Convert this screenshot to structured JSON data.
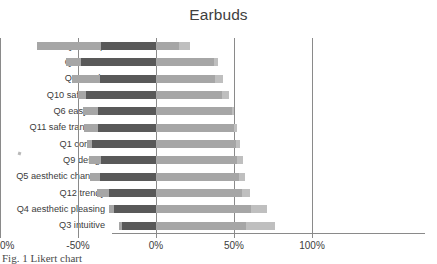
{
  "chart_data": {
    "type": "bar",
    "title": "Earbuds",
    "subtype": "diverging-stacked-bar",
    "orientation": "horizontal",
    "xlabel": "",
    "ylabel": "",
    "xlim": [
      -100,
      100
    ],
    "xticks": [
      -100,
      -50,
      0,
      50,
      100
    ],
    "xticklabels": [
      "-100%",
      "-50%",
      "0%",
      "50%",
      "100%"
    ],
    "grid": true,
    "gridlines_at": [
      -100,
      -50,
      0,
      50,
      100
    ],
    "legend": "none",
    "colors": {
      "strong-negative": "#a6a6a6",
      "negative": "#595959",
      "positive": "#a6a6a6",
      "strong-positive": "#bfbfbf",
      "axis": "#8a8a8a",
      "text": "#3c3c3c"
    },
    "categories": [
      "Q8 cheap",
      "Q2 robust",
      "Q7 trendy",
      "Q10 safe walk",
      "Q6 easy use",
      "Q11 safe transport",
      "Q1 comfort",
      "Q9 design",
      "Q5 aesthetic changes",
      "Q12 trendy",
      "Q4 aesthetic pleasing",
      "Q3 intuitive"
    ],
    "series": [
      {
        "name": "strong-negative",
        "values": [
          -41,
          -10,
          -18,
          -5,
          -10,
          -9,
          -3,
          -8,
          -6,
          -8,
          -3,
          -2
        ]
      },
      {
        "name": "negative",
        "values": [
          -35,
          -48,
          -36,
          -45,
          -37,
          -37,
          -41,
          -35,
          -36,
          -30,
          -27,
          -22
        ]
      },
      {
        "name": "positive",
        "values": [
          15,
          37,
          38,
          42,
          49,
          50,
          51,
          52,
          53,
          55,
          61,
          58
        ]
      },
      {
        "name": "strong-positive",
        "values": [
          7,
          3,
          5,
          5,
          1,
          2,
          3,
          4,
          4,
          5,
          10,
          18
        ]
      }
    ],
    "bars": [
      {
        "label": "Q8 cheap",
        "neg_start": -76,
        "dark_start": -35,
        "pos_end": 22,
        "tip_start": 15
      },
      {
        "label": "Q2 robust",
        "neg_start": -58,
        "dark_start": -48,
        "pos_end": 40,
        "tip_start": 37
      },
      {
        "label": "Q7 trendy",
        "neg_start": -54,
        "dark_start": -36,
        "pos_end": 43,
        "tip_start": 38
      },
      {
        "label": "Q10 safe walk",
        "neg_start": -50,
        "dark_start": -45,
        "pos_end": 47,
        "tip_start": 42
      },
      {
        "label": "Q6 easy use",
        "neg_start": -47,
        "dark_start": -37,
        "pos_end": 50,
        "tip_start": 49
      },
      {
        "label": "Q11 safe transport",
        "neg_start": -46,
        "dark_start": -37,
        "pos_end": 52,
        "tip_start": 50
      },
      {
        "label": "Q1 comfort",
        "neg_start": -44,
        "dark_start": -41,
        "pos_end": 54,
        "tip_start": 51
      },
      {
        "label": "Q9 design",
        "neg_start": -43,
        "dark_start": -35,
        "pos_end": 56,
        "tip_start": 52
      },
      {
        "label": "Q5 aesthetic changes",
        "neg_start": -42,
        "dark_start": -36,
        "pos_end": 57,
        "tip_start": 53
      },
      {
        "label": "Q12 trendy",
        "neg_start": -38,
        "dark_start": -30,
        "pos_end": 60,
        "tip_start": 55
      },
      {
        "label": "Q4 aesthetic pleasing",
        "neg_start": -30,
        "dark_start": -27,
        "pos_end": 71,
        "tip_start": 61
      },
      {
        "label": "Q3 intuitive",
        "neg_start": -24,
        "dark_start": -22,
        "pos_end": 76,
        "tip_start": 58
      }
    ]
  },
  "caption": {
    "text": "Fig. 1  Likert chart"
  }
}
